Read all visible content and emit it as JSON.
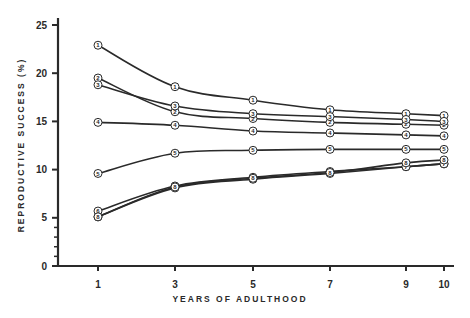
{
  "chart_data": {
    "type": "line",
    "title": "",
    "xlabel": "YEARS OF ADULTHOOD",
    "ylabel": "REPRODUCTIVE SUCCESS (%)",
    "x": [
      1,
      3,
      5,
      7,
      9,
      10
    ],
    "x_tick_labels": [
      "1",
      "3",
      "5",
      "7",
      "9",
      "10"
    ],
    "y_tick_labels": [
      "0",
      "5",
      "10",
      "15",
      "20",
      "25"
    ],
    "y_ticks": [
      0,
      5,
      10,
      15,
      20,
      25
    ],
    "y_minor_ticks": [
      1,
      2,
      3,
      4
    ],
    "ylim": [
      0,
      25
    ],
    "xlim": [
      1,
      10
    ],
    "grid": false,
    "legend": "none (series identified by circled numbers on each data point)",
    "series": [
      {
        "name": "1",
        "values": [
          22.9,
          18.6,
          17.2,
          16.2,
          15.8,
          15.6
        ]
      },
      {
        "name": "2",
        "values": [
          19.5,
          16.0,
          15.3,
          14.9,
          14.7,
          14.6
        ]
      },
      {
        "name": "3",
        "values": [
          18.8,
          16.6,
          15.8,
          15.5,
          15.2,
          15.0
        ]
      },
      {
        "name": "4",
        "values": [
          14.9,
          14.6,
          14.0,
          13.8,
          13.6,
          13.5
        ]
      },
      {
        "name": "5",
        "values": [
          9.6,
          11.7,
          12.0,
          12.1,
          12.1,
          12.1
        ]
      },
      {
        "name": "6",
        "values": [
          5.7,
          8.3,
          9.2,
          9.8,
          10.3,
          10.6
        ]
      },
      {
        "name": "7",
        "values": [
          5.1,
          8.1,
          9.0,
          9.6,
          10.3,
          10.6
        ]
      },
      {
        "name": "8",
        "values": [
          5.1,
          8.2,
          9.1,
          9.7,
          10.7,
          11.0
        ]
      }
    ]
  },
  "colors": {
    "ink": "#2a2a2a",
    "background": "#ffffff"
  }
}
